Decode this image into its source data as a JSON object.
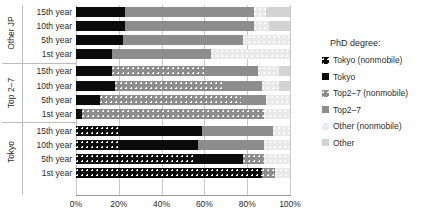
{
  "chart_data": {
    "type": "bar",
    "orientation": "horizontal",
    "stacked": true,
    "title": "",
    "xlabel": "",
    "ylabel": "",
    "xlim": [
      0,
      100
    ],
    "xticks": [
      "0%",
      "20%",
      "40%",
      "60%",
      "80%",
      "100%"
    ],
    "xtick_values": [
      0,
      20,
      40,
      60,
      80,
      100
    ],
    "grid": true,
    "legend_position": "right",
    "legend_title": "PhD degree:",
    "series": [
      {
        "name": "Tokyo (nonmobile)",
        "key": "tokyo_nm",
        "color": "#0b0b0b",
        "pattern": "dots"
      },
      {
        "name": "Tokyo",
        "key": "tokyo",
        "color": "#0b0b0b",
        "pattern": "solid"
      },
      {
        "name": "Top2–7 (nonmobile)",
        "key": "top_nm",
        "color": "#8d8d8d",
        "pattern": "dots"
      },
      {
        "name": "Top2–7",
        "key": "top",
        "color": "#8d8d8d",
        "pattern": "solid"
      },
      {
        "name": "Other (nonmobile)",
        "key": "other_nm",
        "color": "#e9e9e9",
        "pattern": "dots"
      },
      {
        "name": "Other",
        "key": "other",
        "color": "#d3d3d3",
        "pattern": "solid"
      }
    ],
    "groups": [
      {
        "name": "Other JP",
        "rows": [
          {
            "label": "15th year",
            "values": {
              "tokyo_nm": 0,
              "tokyo": 23,
              "top_nm": 0,
              "top": 60,
              "other_nm": 6,
              "other": 11
            }
          },
          {
            "label": "10th year",
            "values": {
              "tokyo_nm": 0,
              "tokyo": 23,
              "top_nm": 0,
              "top": 60,
              "other_nm": 7,
              "other": 10
            }
          },
          {
            "label": "5th year",
            "values": {
              "tokyo_nm": 0,
              "tokyo": 22,
              "top_nm": 0,
              "top": 56,
              "other_nm": 22,
              "other": 0
            }
          },
          {
            "label": "1st year",
            "values": {
              "tokyo_nm": 0,
              "tokyo": 17,
              "top_nm": 0,
              "top": 46,
              "other_nm": 37,
              "other": 0
            }
          }
        ]
      },
      {
        "name": "Top 2–7",
        "rows": [
          {
            "label": "15th year",
            "values": {
              "tokyo_nm": 0,
              "tokyo": 17,
              "top_nm": 43,
              "top": 25,
              "other_nm": 10,
              "other": 5
            }
          },
          {
            "label": "10th year",
            "values": {
              "tokyo_nm": 0,
              "tokyo": 18,
              "top_nm": 51,
              "top": 18,
              "other_nm": 8,
              "other": 5
            }
          },
          {
            "label": "5th year",
            "values": {
              "tokyo_nm": 0,
              "tokyo": 11,
              "top_nm": 66,
              "top": 12,
              "other_nm": 11,
              "other": 0
            }
          },
          {
            "label": "1st year",
            "values": {
              "tokyo_nm": 0,
              "tokyo": 3,
              "top_nm": 85,
              "top": 0,
              "other_nm": 12,
              "other": 0
            }
          }
        ]
      },
      {
        "name": "Tokyo",
        "rows": [
          {
            "label": "15th year",
            "values": {
              "tokyo_nm": 21,
              "tokyo": 38,
              "top_nm": 0,
              "top": 33,
              "other_nm": 8,
              "other": 0
            }
          },
          {
            "label": "10th year",
            "values": {
              "tokyo_nm": 21,
              "tokyo": 36,
              "top_nm": 0,
              "top": 31,
              "other_nm": 12,
              "other": 0
            }
          },
          {
            "label": "5th year",
            "values": {
              "tokyo_nm": 56,
              "tokyo": 22,
              "top_nm": 10,
              "top": 0,
              "other_nm": 12,
              "other": 0
            }
          },
          {
            "label": "1st year",
            "values": {
              "tokyo_nm": 87,
              "tokyo": 0,
              "top_nm": 6,
              "top": 0,
              "other_nm": 7,
              "other": 0
            }
          }
        ]
      }
    ]
  }
}
